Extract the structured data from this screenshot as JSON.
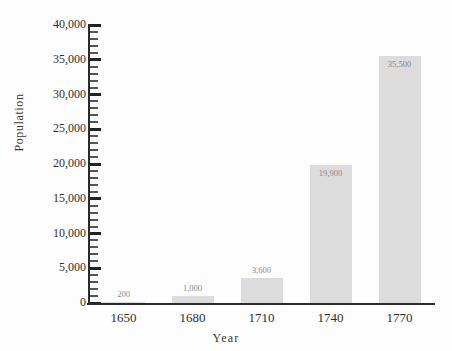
{
  "chart_data": {
    "type": "bar",
    "title": "",
    "xlabel": "Year",
    "ylabel": "Population",
    "categories": [
      "1650",
      "1680",
      "1710",
      "1740",
      "1770"
    ],
    "values": [
      200,
      1000,
      3600,
      19900,
      35500
    ],
    "value_labels": [
      "200",
      "1,000",
      "3,600",
      "19,900",
      "35,500"
    ],
    "ylim": [
      0,
      40000
    ],
    "ytick_major_step": 5000,
    "ytick_minor_step": 1000,
    "ytick_labels": [
      "0",
      "5,000",
      "10,000",
      "15,000",
      "20,000",
      "25,000",
      "30,000",
      "35,000",
      "40,000"
    ],
    "ytick_values": [
      0,
      5000,
      10000,
      15000,
      20000,
      25000,
      30000,
      35000,
      40000
    ],
    "grid": false,
    "legend": null,
    "bar_color": "#dcdcdc",
    "axis_color": "#2b2b2b",
    "label_color": "#8a8a8a",
    "text_color": "#2f2f2f",
    "background": "#fdfdfd"
  }
}
